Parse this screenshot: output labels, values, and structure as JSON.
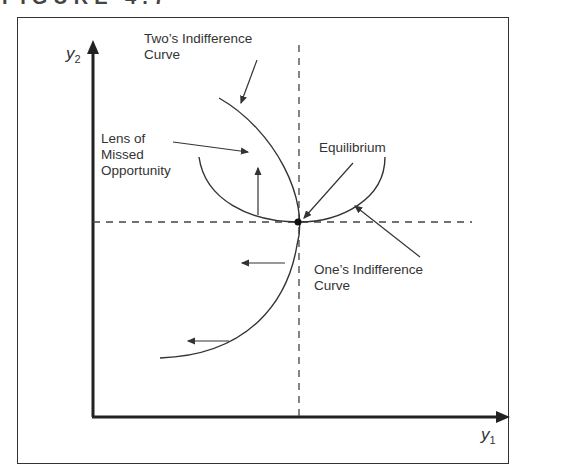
{
  "figure": {
    "title": "FIGURE 4.7"
  },
  "axes": {
    "y_label": "y",
    "y_sub": "2",
    "x_label": "y",
    "x_sub": "1"
  },
  "labels": {
    "twos_curve_1": "Two’s Indifference",
    "twos_curve_2": "Curve",
    "lens_1": "Lens of",
    "lens_2": "Missed",
    "lens_3": "Opportunity",
    "equilibrium": "Equilibrium",
    "ones_curve_1": "One’s Indifference",
    "ones_curve_2": "Curve"
  },
  "colors": {
    "line": "#333333",
    "background": "#ffffff"
  }
}
